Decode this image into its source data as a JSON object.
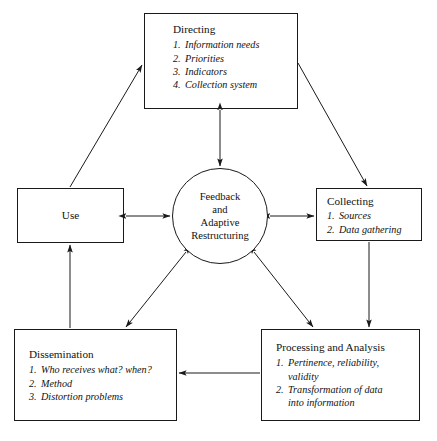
{
  "diagram": {
    "stroke_color": "#1a1a1a",
    "text_color": "#111111",
    "background": "#ffffff"
  },
  "hub": {
    "lines": [
      "Feedback",
      "and",
      "Adaptive",
      "Restructuring"
    ]
  },
  "nodes": {
    "directing": {
      "title": "Directing",
      "items": [
        {
          "num": "1.",
          "text": "Information needs"
        },
        {
          "num": "2.",
          "text": "Priorities"
        },
        {
          "num": "3.",
          "text": "Indicators"
        },
        {
          "num": "4.",
          "text": "Collection system"
        }
      ]
    },
    "collecting": {
      "title": "Collecting",
      "items": [
        {
          "num": "1.",
          "text": "Sources"
        },
        {
          "num": "2.",
          "text": "Data gathering"
        }
      ]
    },
    "use": {
      "title": "Use",
      "items": []
    },
    "dissemination": {
      "title": "Dissemination",
      "items": [
        {
          "num": "1.",
          "text": "Who receives what? when?"
        },
        {
          "num": "2.",
          "text": "Method"
        },
        {
          "num": "3.",
          "text": "Distortion problems"
        }
      ]
    },
    "processing": {
      "title": "Processing and Analysis",
      "items": [
        {
          "num": "1.",
          "text": "Pertinence, reliability,\nvalidity"
        },
        {
          "num": "2.",
          "text": "Transformation of data\ninto information"
        }
      ]
    }
  },
  "edges": [
    {
      "from": "use",
      "to": "directing",
      "style": "single-arrow"
    },
    {
      "from": "directing",
      "to": "collecting",
      "style": "single-arrow"
    },
    {
      "from": "directing",
      "to": "hub",
      "style": "double-arrow"
    },
    {
      "from": "use",
      "to": "hub",
      "style": "double-arrow"
    },
    {
      "from": "hub",
      "to": "collecting",
      "style": "double-arrow"
    },
    {
      "from": "collecting",
      "to": "processing",
      "style": "single-arrow"
    },
    {
      "from": "processing",
      "to": "dissemination",
      "style": "single-arrow"
    },
    {
      "from": "dissemination",
      "to": "use",
      "style": "single-arrow"
    },
    {
      "from": "dissemination",
      "to": "hub",
      "style": "single-arrow"
    },
    {
      "from": "processing",
      "to": "hub",
      "style": "single-arrow"
    }
  ]
}
